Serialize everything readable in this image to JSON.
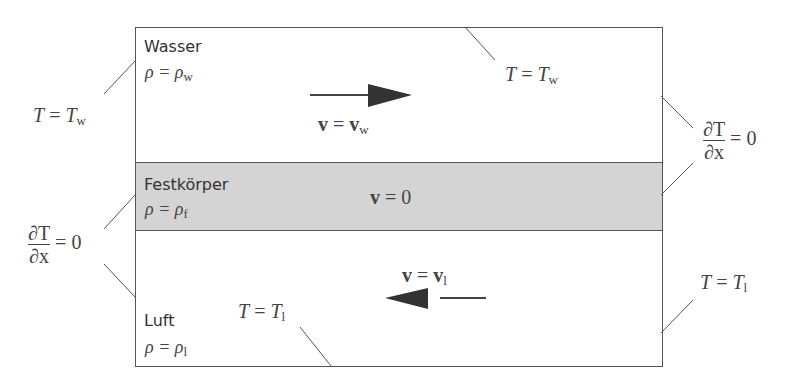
{
  "diagram": {
    "regions": [
      {
        "name": "Wasser",
        "density": "ρ = ρ",
        "density_sub": "w",
        "fill": "#ffffff"
      },
      {
        "name": "Festkörper",
        "density": "ρ = ρ",
        "density_sub": "f",
        "fill": "#d4d4d4"
      },
      {
        "name": "Luft",
        "density": "ρ = ρ",
        "density_sub": "l",
        "fill": "#ffffff"
      }
    ],
    "velocities": {
      "water": {
        "lhs": "v",
        "rhs": "v",
        "sub": "w",
        "direction": "right"
      },
      "solid": {
        "lhs": "v",
        "rhs": "0"
      },
      "air": {
        "lhs": "v",
        "rhs": "v",
        "sub": "l",
        "direction": "left"
      }
    },
    "boundary_conditions": {
      "left_water": {
        "lhs": "T",
        "rhs": "T",
        "sub": "w"
      },
      "top_water": {
        "lhs": "T",
        "rhs": "T",
        "sub": "w"
      },
      "right_neumann": {
        "num": "∂T",
        "den": "∂x",
        "rhs": "= 0"
      },
      "left_neumann": {
        "num": "∂T",
        "den": "∂x",
        "rhs": "= 0"
      },
      "bottom_air": {
        "lhs": "T",
        "rhs": "T",
        "sub": "l"
      },
      "right_air": {
        "lhs": "T",
        "rhs": "T",
        "sub": "l"
      }
    },
    "eq": " = "
  }
}
